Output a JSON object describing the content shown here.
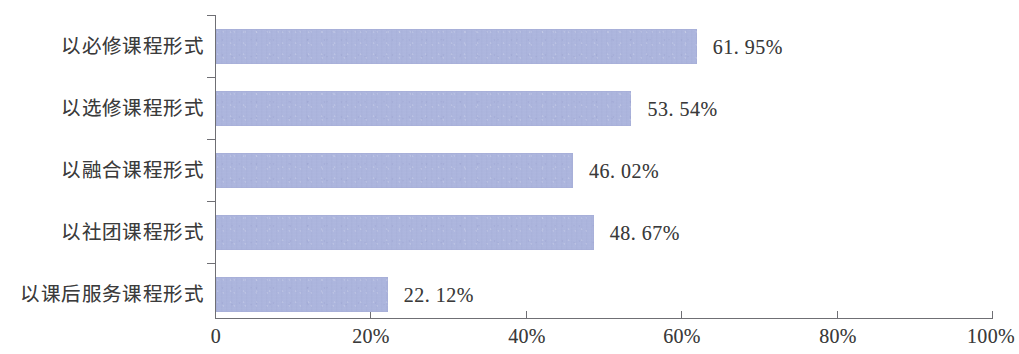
{
  "chart_data": {
    "type": "bar",
    "orientation": "horizontal",
    "title": "",
    "subtitle": "",
    "xlabel": "",
    "ylabel": "",
    "categories": [
      "以必修课程形式",
      "以选修课程形式",
      "以融合课程形式",
      "以社团课程形式",
      "以课后服务课程形式"
    ],
    "values": [
      61.95,
      53.54,
      46.02,
      48.67,
      22.12
    ],
    "value_labels": [
      "61. 95%",
      "53. 54%",
      "46. 02%",
      "48. 67%",
      "22. 12%"
    ],
    "xlim": [
      0,
      100
    ],
    "x_ticks": [
      0,
      20,
      40,
      60,
      80,
      100
    ],
    "x_tick_labels": [
      "0",
      "20%",
      "40%",
      "60%",
      "80%",
      "100%"
    ],
    "grid": false,
    "legend": null,
    "bar_color": "#a9b2dc",
    "axis_color": "#6f6f74",
    "text_color": "#3a3a3a",
    "background_color": "#ffffff"
  }
}
